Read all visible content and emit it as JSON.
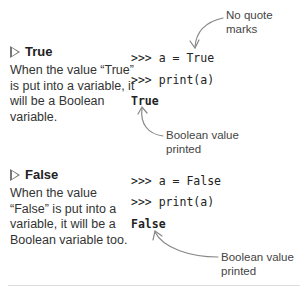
{
  "sections": [
    {
      "heading": "True",
      "description": "When the value “True” is put into a variable, it will be a Boolean variable.",
      "code": [
        ">>> a = True",
        ">>> print(a)"
      ],
      "output": "True",
      "annotations": [
        {
          "text": "No quote marks",
          "lines": [
            "No quote",
            "marks"
          ]
        },
        {
          "text": "Boolean value printed",
          "lines": [
            "Boolean value",
            "printed"
          ]
        }
      ]
    },
    {
      "heading": "False",
      "description": "When the value “False” is put into a variable, it will be a Boolean variable too.",
      "code": [
        ">>> a = False",
        ">>> print(a)"
      ],
      "output": "False",
      "annotations": [
        {
          "text": "Boolean value printed",
          "lines": [
            "Boolean value",
            "printed"
          ]
        }
      ]
    }
  ],
  "icons": {
    "bullet": "triangle-outline-icon"
  },
  "colors": {
    "text": "#333333",
    "arrow": "#888888",
    "divider": "#dddddd"
  }
}
